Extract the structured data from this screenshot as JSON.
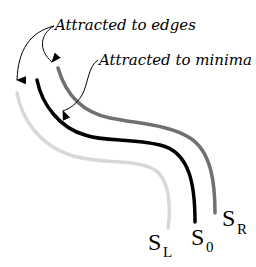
{
  "annotations": {
    "edges_label": "Attracted to edges",
    "minima_label": "Attracted to minima"
  },
  "curves": [
    {
      "id": "S_L",
      "symbol": "S",
      "subscript": "L",
      "color": "#d8d8d8"
    },
    {
      "id": "S_0",
      "symbol": "S",
      "subscript": "0",
      "color": "#000000"
    },
    {
      "id": "S_R",
      "symbol": "S",
      "subscript": "R",
      "color": "#707070"
    }
  ]
}
